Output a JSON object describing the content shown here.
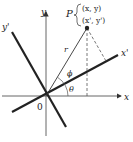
{
  "diagram": {
    "axes": {
      "x_label": "x",
      "y_label": "y",
      "x_prime_label": "x'",
      "y_prime_label": "y'",
      "origin_label": "0"
    },
    "point": {
      "name": "P",
      "coords_original": "(x, y)",
      "coords_rotated": "(x', y')"
    },
    "labels": {
      "radius": "r",
      "angle_phi": "ϕ",
      "angle_theta": "θ"
    },
    "colors": {
      "line": "#222222",
      "axis": "#555555",
      "background": "#ffffff"
    }
  }
}
